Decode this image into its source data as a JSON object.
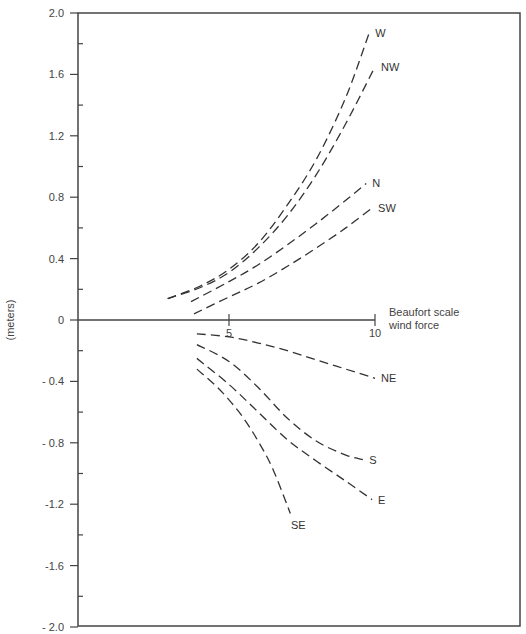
{
  "chart_data": {
    "type": "line",
    "title": "",
    "xlabel": "Beaufort scale wind force",
    "xlabel_lines": [
      "Beaufort scale",
      "wind force"
    ],
    "ylabel": "(meters)",
    "xlim": [
      0,
      10
    ],
    "ylim": [
      -2.0,
      2.0
    ],
    "grid": false,
    "legend": "inline labels at curve ends",
    "x_ticks": [
      5,
      10
    ],
    "x_tick_labels": [
      "5",
      "10"
    ],
    "y_ticks": [
      2.0,
      1.6,
      1.2,
      0.8,
      0.4,
      0,
      -0.4,
      -0.8,
      -1.2,
      -1.6,
      -2.0
    ],
    "y_tick_labels": [
      "2.0",
      "1.6",
      "1.2",
      "0.8",
      "0.4",
      "0",
      "- 0.4",
      "- 0.8",
      "-1.2",
      "-1.6",
      "- 2.0"
    ],
    "series": [
      {
        "name": "W",
        "x": [
          2.9,
          4.0,
          5.0,
          6.0,
          7.0,
          8.0,
          9.0,
          9.8
        ],
        "y": [
          0.14,
          0.22,
          0.33,
          0.5,
          0.75,
          1.05,
          1.45,
          1.87
        ]
      },
      {
        "name": "NW",
        "x": [
          2.9,
          4.0,
          5.0,
          6.0,
          7.0,
          8.0,
          9.0,
          10.0
        ],
        "y": [
          0.14,
          0.21,
          0.31,
          0.47,
          0.68,
          0.95,
          1.28,
          1.65
        ]
      },
      {
        "name": "N",
        "x": [
          3.7,
          5.0,
          6.0,
          7.0,
          8.0,
          9.0,
          9.7
        ],
        "y": [
          0.12,
          0.25,
          0.36,
          0.49,
          0.63,
          0.78,
          0.89
        ]
      },
      {
        "name": "SW",
        "x": [
          3.8,
          5.0,
          6.0,
          7.0,
          8.0,
          9.0,
          9.9
        ],
        "y": [
          0.04,
          0.15,
          0.24,
          0.35,
          0.47,
          0.6,
          0.73
        ]
      },
      {
        "name": "NE",
        "x": [
          3.9,
          5.0,
          6.0,
          7.0,
          8.0,
          9.0,
          10.0
        ],
        "y": [
          -0.09,
          -0.11,
          -0.15,
          -0.2,
          -0.26,
          -0.32,
          -0.38
        ]
      },
      {
        "name": "S",
        "x": [
          3.9,
          5.0,
          6.0,
          7.0,
          8.0,
          9.0,
          9.6
        ],
        "y": [
          -0.16,
          -0.27,
          -0.44,
          -0.64,
          -0.79,
          -0.88,
          -0.91
        ]
      },
      {
        "name": "E",
        "x": [
          3.9,
          5.0,
          6.0,
          7.0,
          8.0,
          9.0,
          9.9
        ],
        "y": [
          -0.25,
          -0.42,
          -0.6,
          -0.78,
          -0.92,
          -1.05,
          -1.17
        ]
      },
      {
        "name": "SE",
        "x": [
          3.9,
          4.5,
          5.0,
          5.5,
          6.0,
          6.5,
          7.1
        ],
        "y": [
          -0.32,
          -0.42,
          -0.52,
          -0.64,
          -0.79,
          -0.97,
          -1.26
        ]
      }
    ]
  }
}
